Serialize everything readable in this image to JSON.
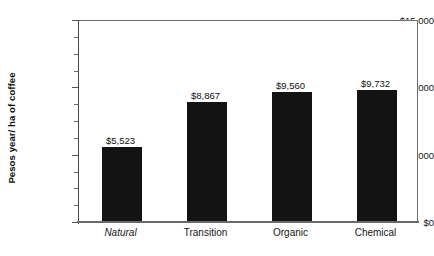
{
  "chart_data": {
    "type": "bar",
    "title": "",
    "subtitle": "",
    "xlabel": "",
    "ylabel": "Pesos year/ ha of coffee",
    "categories": [
      "Natural",
      "Transition",
      "Organic",
      "Chemical"
    ],
    "values": [
      5523,
      8867,
      9560,
      9732
    ],
    "value_labels": [
      "$5,523",
      "$8,867",
      "$9,560",
      "$9,732"
    ],
    "ylim": [
      0,
      15000
    ],
    "y_ticks": [
      0,
      5000,
      10000,
      15000
    ],
    "y_tick_labels": [
      "$0",
      "$5,000",
      "$10,000",
      "$15,000"
    ],
    "y_minor_tick_step": 1250,
    "grid": false,
    "legend": false,
    "legend_position": "none",
    "bar_color": "#131313",
    "axis_color": "#6f6f6f",
    "background_color": "#ffffff",
    "italic_categories": [
      "Natural"
    ]
  },
  "axis": {
    "y_title": "Pesos year/ ha of coffee"
  }
}
